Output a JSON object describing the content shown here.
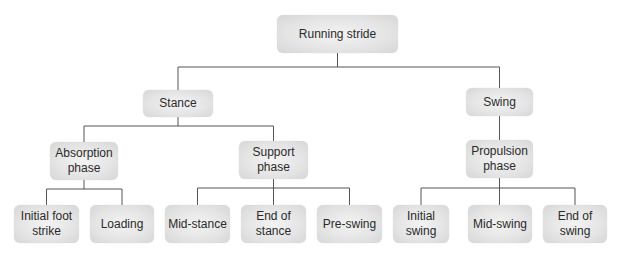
{
  "diagram": {
    "type": "tree",
    "root": {
      "label": "Running stride",
      "children": [
        {
          "label": "Stance",
          "children": [
            {
              "label": "Absorption phase",
              "children": [
                {
                  "label": "Initial foot strike"
                },
                {
                  "label": "Loading"
                }
              ]
            },
            {
              "label": "Support phase",
              "children": [
                {
                  "label": "Mid-stance"
                },
                {
                  "label": "End of stance"
                },
                {
                  "label": "Pre-swing"
                }
              ]
            }
          ]
        },
        {
          "label": "Swing",
          "children": [
            {
              "label": "Propulsion phase",
              "children": [
                {
                  "label": "Initial swing"
                },
                {
                  "label": "Mid-swing"
                },
                {
                  "label": "End of swing"
                }
              ]
            }
          ]
        }
      ]
    }
  },
  "nodes": {
    "running_stride": "Running stride",
    "stance": "Stance",
    "swing": "Swing",
    "absorption_phase": "Absorption phase",
    "support_phase": "Support phase",
    "propulsion_phase": "Propulsion phase",
    "initial_foot_strike": "Initial foot strike",
    "loading": "Loading",
    "mid_stance": "Mid-stance",
    "end_of_stance": "End of stance",
    "pre_swing": "Pre-swing",
    "initial_swing": "Initial swing",
    "mid_swing": "Mid-swing",
    "end_of_swing": "End of swing"
  },
  "colors": {
    "node_fill": "#e4e4e4",
    "connector": "#555555",
    "text": "#2a2a2a"
  }
}
